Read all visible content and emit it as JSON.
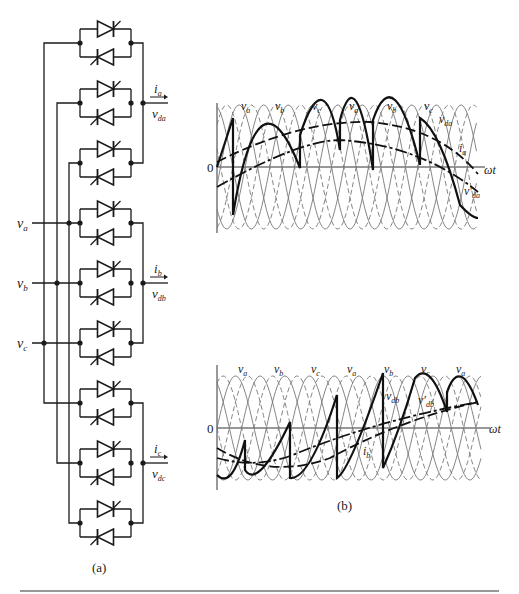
{
  "circuit": {
    "caption": "(a)",
    "inputs": [
      {
        "label": "v",
        "sub": "a"
      },
      {
        "label": "v",
        "sub": "b"
      },
      {
        "label": "v",
        "sub": "c"
      }
    ],
    "outputs": [
      {
        "current": "i",
        "current_sub": "a",
        "voltage": "v",
        "voltage_sub": "da"
      },
      {
        "current": "i",
        "current_sub": "b",
        "voltage": "v",
        "voltage_sub": "db"
      },
      {
        "current": "i",
        "current_sub": "c",
        "voltage": "v",
        "voltage_sub": "dc"
      }
    ],
    "thyristor_pairs": 9
  },
  "waveforms": {
    "caption": "(b)",
    "top": {
      "zero_label": "0",
      "axis_label": "ωt",
      "phase_labels": [
        {
          "t": "v",
          "s": "a"
        },
        {
          "t": "v",
          "s": "b"
        },
        {
          "t": "v",
          "s": "c"
        },
        {
          "t": "v",
          "s": "a"
        },
        {
          "t": "v",
          "s": "b"
        },
        {
          "t": "v",
          "s": "c"
        }
      ],
      "vd_label": {
        "t": "v",
        "s": "da"
      },
      "i_label": {
        "t": "i",
        "s": "a"
      },
      "vdp_label": {
        "t": "v′",
        "s": "da"
      }
    },
    "bottom": {
      "zero_label": "0",
      "axis_label": "ωt",
      "phase_labels": [
        {
          "t": "v",
          "s": "a"
        },
        {
          "t": "v",
          "s": "b"
        },
        {
          "t": "v",
          "s": "c"
        },
        {
          "t": "v",
          "s": "a"
        },
        {
          "t": "v",
          "s": "b"
        },
        {
          "t": "v",
          "s": "c"
        },
        {
          "t": "v",
          "s": "a"
        }
      ],
      "vd_label": {
        "t": "v",
        "s": "db"
      },
      "vdp_label": {
        "t": "v′",
        "s": "db"
      },
      "i_label": {
        "t": "i",
        "s": "b"
      }
    }
  }
}
